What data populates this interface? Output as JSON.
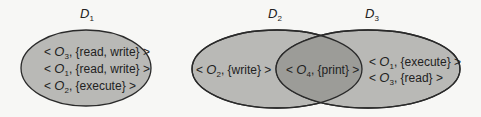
{
  "colors": {
    "background": "#f7f7f5",
    "domain_fill": "#b9b9b6",
    "intersection_fill": "#9c9c98",
    "stroke": "#2a2a2a",
    "text": "#222222"
  },
  "domains": [
    {
      "name": "D",
      "subscript": "1",
      "entries": [
        {
          "open": "< ",
          "object": "O",
          "object_sub": "3",
          "rights": ", {read, write} >"
        },
        {
          "open": "< ",
          "object": "O",
          "object_sub": "1",
          "rights": ", {read, write} >"
        },
        {
          "open": "< ",
          "object": "O",
          "object_sub": "2",
          "rights": ", {execute} >"
        }
      ]
    },
    {
      "name": "D",
      "subscript": "2",
      "entries": [
        {
          "open": "< ",
          "object": "O",
          "object_sub": "2",
          "rights": ", {write} >"
        }
      ]
    },
    {
      "name": "D",
      "subscript": "3",
      "entries": [
        {
          "open": "< ",
          "object": "O",
          "object_sub": "1",
          "rights": ", {execute} >"
        },
        {
          "open": "< ",
          "object": "O",
          "object_sub": "3",
          "rights": ", {read} >"
        }
      ]
    }
  ],
  "shared": {
    "between": "D2 ∩ D3",
    "entries": [
      {
        "open": "< ",
        "object": "O",
        "object_sub": "4",
        "rights": ", {print} >"
      }
    ]
  }
}
